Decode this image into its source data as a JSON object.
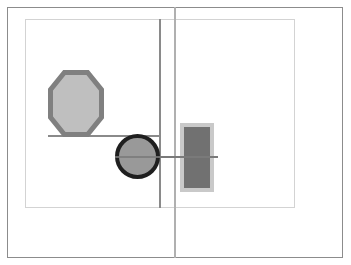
{
  "canvas": {
    "name": "shape-canvas",
    "width": 351,
    "height": 265,
    "background_color": "#ffffff"
  },
  "frames": {
    "outer": {
      "label": "outer-frame",
      "x": 7,
      "y": 7,
      "width": 336,
      "height": 251,
      "border_color": "#8c8c8c",
      "border_width": 1
    },
    "inner": {
      "label": "inner-frame",
      "x": 25,
      "y": 19,
      "width": 270,
      "height": 189,
      "border_color": "#d3d3d3",
      "border_width": 1
    }
  },
  "guides": {
    "vertical_light": {
      "label": "vertical-guide-light",
      "x": 174,
      "y": 7,
      "width": 2,
      "height": 251,
      "color": "#b0b0b0"
    },
    "vertical_dark": {
      "label": "vertical-guide-dark",
      "x": 159,
      "y": 19,
      "width": 2,
      "height": 189,
      "color": "#8a8a8a"
    },
    "horizontal_upper": {
      "label": "horizontal-guide-upper",
      "x": 48,
      "y": 135,
      "width": 113,
      "height": 2,
      "color": "#8a8a8a"
    },
    "horizontal_lower": {
      "label": "horizontal-guide-lower",
      "x": 115,
      "y": 156,
      "width": 103,
      "height": 2,
      "color": "#7a7a7a"
    }
  },
  "shapes": [
    {
      "id": "octagon",
      "label": "octagon-shape",
      "type": "octagon",
      "x": 48,
      "y": 70,
      "width": 56,
      "height": 67,
      "fill_color": "#bfbfbf",
      "stroke_color": "#808080",
      "stroke_width": 5
    },
    {
      "id": "circle",
      "label": "circle-shape",
      "type": "circle",
      "x": 115,
      "y": 134,
      "width": 45,
      "height": 45,
      "fill_color": "#999999",
      "stroke_color": "#1f1f1f",
      "stroke_width": 4
    },
    {
      "id": "rectangle",
      "label": "rectangle-shape",
      "type": "rectangle",
      "x": 180,
      "y": 123,
      "width": 34,
      "height": 69,
      "fill_color": "#c9c9c9",
      "inner_x": 184,
      "inner_y": 127,
      "inner_width": 26,
      "inner_height": 61,
      "inner_fill_color": "#717171"
    }
  ]
}
